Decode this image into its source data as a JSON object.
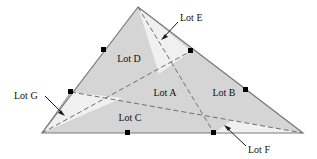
{
  "figure": {
    "background": "#ffffff",
    "colors": {
      "fill_main": "#d5d5d5",
      "fill_light": "#efefef",
      "outline": "#808080",
      "dashed": "#6e6e6e",
      "dot": "#000000",
      "text": "#111111",
      "leader": "#1a1a1a"
    },
    "triangle": {
      "apex": [
        138,
        7
      ],
      "bottom_left": [
        42,
        133
      ],
      "bottom_right": [
        303,
        133
      ]
    },
    "edge_points": [
      {
        "name": "left-upper-point",
        "x": 104,
        "y": 50
      },
      {
        "name": "left-lower-point",
        "x": 71,
        "y": 92
      },
      {
        "name": "right-upper-point",
        "x": 191,
        "y": 51
      },
      {
        "name": "right-lower-point",
        "x": 246,
        "y": 90
      },
      {
        "name": "bottom-left-point",
        "x": 128,
        "y": 133
      },
      {
        "name": "bottom-right-point",
        "x": 214,
        "y": 133
      }
    ],
    "inner_labels": [
      {
        "id": "lot-d",
        "text": "Lot D",
        "x": 129,
        "y": 62
      },
      {
        "id": "lot-a",
        "text": "Lot A",
        "x": 165,
        "y": 96
      },
      {
        "id": "lot-b",
        "text": "Lot B",
        "x": 224,
        "y": 96
      },
      {
        "id": "lot-c",
        "text": "Lot C",
        "x": 130,
        "y": 121
      }
    ],
    "callouts": [
      {
        "id": "lot-e",
        "text": "Lot E",
        "label_x": 180,
        "label_y": 18,
        "leader": {
          "x1": 178,
          "y1": 22,
          "x2": 163,
          "y2": 38
        }
      },
      {
        "id": "lot-g",
        "text": "Lot G",
        "label_x": 14,
        "label_y": 99,
        "leader": {
          "x1": 45,
          "y1": 96,
          "x2": 63,
          "y2": 114
        }
      },
      {
        "id": "lot-f",
        "text": "Lot F",
        "label_x": 248,
        "label_y": 152,
        "leader": {
          "x1": 246,
          "y1": 146,
          "x2": 226,
          "y2": 127
        }
      }
    ]
  }
}
